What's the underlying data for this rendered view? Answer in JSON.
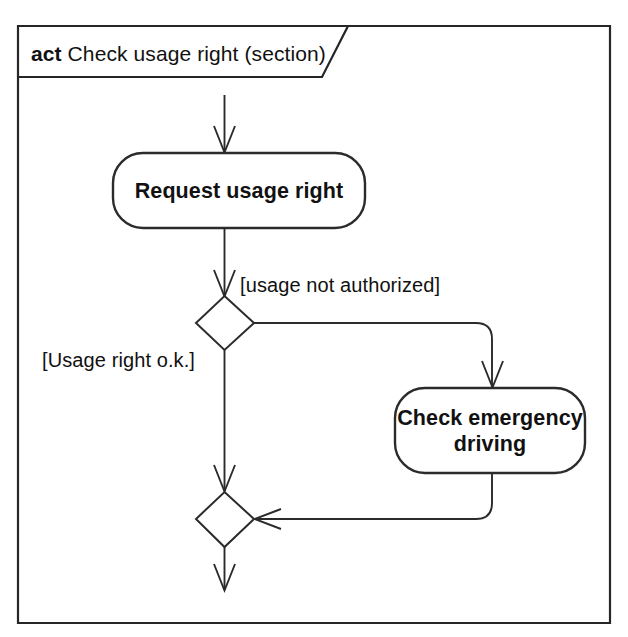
{
  "diagram": {
    "kind": "uml-activity-diagram",
    "frame": {
      "keyword": "act",
      "name": "Check usage right (section)",
      "title_full": "act Check usage right (section)"
    },
    "nodes": [
      {
        "id": "request-usage-right",
        "type": "action",
        "label": "Request usage right"
      },
      {
        "id": "check-emergency-driving",
        "type": "action",
        "label_line1": "Check emergency",
        "label_line2": "driving",
        "label": "Check emergency driving"
      },
      {
        "id": "decision-usage-right",
        "type": "decision",
        "label": ""
      },
      {
        "id": "merge-node",
        "type": "merge",
        "label": ""
      }
    ],
    "edges": [
      {
        "id": "edge-initial-to-request",
        "from": "frame-entry",
        "to": "request-usage-right",
        "guard": ""
      },
      {
        "id": "edge-request-to-decision",
        "from": "request-usage-right",
        "to": "decision-usage-right",
        "guard": ""
      },
      {
        "id": "edge-decision-to-check",
        "from": "decision-usage-right",
        "to": "check-emergency-driving",
        "guard": "[usage not authorized]"
      },
      {
        "id": "edge-decision-to-merge",
        "from": "decision-usage-right",
        "to": "merge-node",
        "guard": "[Usage right o.k.]"
      },
      {
        "id": "edge-check-to-merge",
        "from": "check-emergency-driving",
        "to": "merge-node",
        "guard": ""
      },
      {
        "id": "edge-merge-to-exit",
        "from": "merge-node",
        "to": "frame-exit",
        "guard": ""
      }
    ],
    "guards": {
      "usage_not_authorized": "[usage not authorized]",
      "usage_right_ok": "[Usage right o.k.]"
    },
    "colors": {
      "background": "#ffffff",
      "stroke": "#2b2b2b",
      "frame_stroke": "#262626",
      "text": "#111111",
      "node_fill": "#ffffff"
    }
  }
}
